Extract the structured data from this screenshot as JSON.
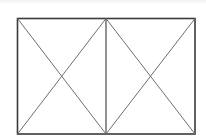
{
  "diagram": {
    "colors": {
      "frame": "#3a3a3a",
      "diagonals": "#6e6e6e",
      "background": "#ffffff"
    },
    "frame": {
      "x1": 17.5,
      "y1": 18.5,
      "x2": 195,
      "y2": 134
    },
    "divider_x": 106,
    "panels": [
      {
        "name": "left",
        "x1": 17.5,
        "x2": 106
      },
      {
        "name": "right",
        "x1": 106,
        "x2": 195
      }
    ]
  }
}
